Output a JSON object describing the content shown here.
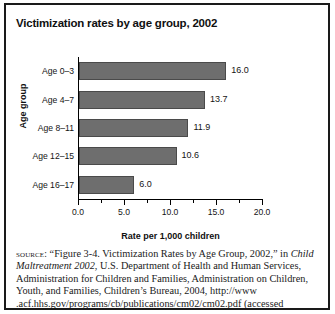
{
  "figure": {
    "title": "Victimization rates by age group, 2002"
  },
  "chart_data": {
    "type": "bar",
    "orientation": "horizontal",
    "title": "Victimization rates by age group, 2002",
    "xlabel": "Rate per 1,000 children",
    "ylabel": "Age group",
    "categories": [
      "Age 0–3",
      "Age 4–7",
      "Age 8–11",
      "Age 12–15",
      "Age 16–17"
    ],
    "values": [
      16.0,
      13.7,
      11.9,
      10.6,
      6.0
    ],
    "value_labels": [
      "16.0",
      "13.7",
      "11.9",
      "10.6",
      "6.0"
    ],
    "xlim": [
      0.0,
      20.0
    ],
    "xticks": [
      0.0,
      5.0,
      10.0,
      15.0,
      20.0
    ],
    "xtick_labels": [
      "0.0",
      "5.0",
      "10.0",
      "15.0",
      "20.0"
    ],
    "minor_xticks": [
      2.5,
      7.5,
      12.5,
      17.5
    ],
    "grid": false,
    "legend": false,
    "bar_color": "#6e6e6e",
    "bar_edge_color": "#4a4a4a"
  },
  "source": {
    "label": "source:",
    "text_1": " “Figure 3-4. Victimization Rates by Age Group, 2002,” in ",
    "title_italic": "Child Maltreatment 2002",
    "text_2": ", U.S. Department of Health and Human Services, Administration for Children and Families, Administration on Children, Youth, and Families, Children’s Bureau, 2004, http://www .acf.hhs.gov/programs/cb/publications/cm02/cm02.pdf (accessed"
  }
}
